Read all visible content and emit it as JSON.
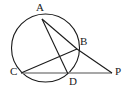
{
  "figure": {
    "type": "geometry-diagram",
    "background_color": "#ffffff",
    "stroke_color": "#1a1a1a",
    "secant_color": "#8a8a8a",
    "labels": [
      {
        "id": "A",
        "text": "A",
        "x": 36,
        "y": 2
      },
      {
        "id": "B",
        "text": "B",
        "x": 80,
        "y": 36
      },
      {
        "id": "C",
        "text": "C",
        "x": 10,
        "y": 66
      },
      {
        "id": "D",
        "text": "D",
        "x": 69,
        "y": 76
      },
      {
        "id": "P",
        "text": "P",
        "x": 115,
        "y": 66
      }
    ],
    "points": {
      "A": {
        "x": 42,
        "y": 19
      },
      "B": {
        "x": 77,
        "y": 49
      },
      "C": {
        "x": 21,
        "y": 73
      },
      "D": {
        "x": 68,
        "y": 73
      },
      "P": {
        "x": 112,
        "y": 73
      }
    },
    "circle": {
      "cx": 45.5,
      "cy": 48,
      "r": 34
    },
    "segments": [
      {
        "name": "A-B",
        "from": "A",
        "to": "B"
      },
      {
        "name": "B-P",
        "from": "B",
        "to": "P"
      },
      {
        "name": "A-D",
        "from": "A",
        "to": "D"
      },
      {
        "name": "C-B",
        "from": "C",
        "to": "B"
      },
      {
        "name": "C-P",
        "from": "C",
        "to": "P"
      },
      {
        "name": "D-P",
        "from": "D",
        "to": "P"
      }
    ]
  }
}
